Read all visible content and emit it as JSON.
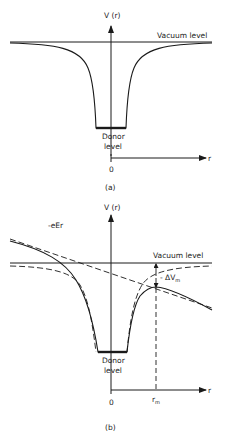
{
  "figure": {
    "panel_a": {
      "y_axis_label": "V (r)",
      "vacuum_label": "Vacuum level",
      "donor_label_line1": "Donor",
      "donor_label_line2": "level",
      "origin_label": "0",
      "x_axis_label": "r",
      "caption": "(a)"
    },
    "panel_b": {
      "y_axis_label": "V (r)",
      "field_label": "-eEr",
      "vacuum_label": "Vacuum level",
      "barrier_label": "- ΔV",
      "barrier_sub": "m",
      "donor_label_line1": "Donor",
      "donor_label_line2": "level",
      "origin_label": "0",
      "x_axis_label": "r",
      "rm_label": "r",
      "rm_sub": "m",
      "caption": "(b)"
    },
    "colors": {
      "line": "#1a1a1a",
      "background": "#ffffff"
    }
  }
}
